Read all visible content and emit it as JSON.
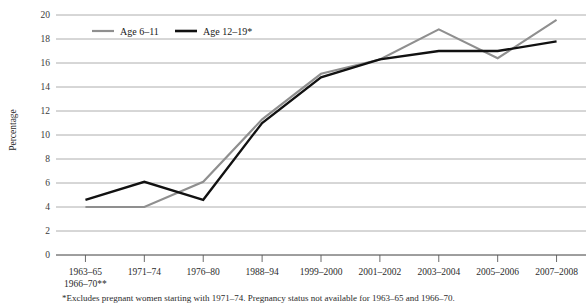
{
  "chart_data": {
    "type": "line",
    "title": "",
    "xlabel": "",
    "ylabel": "Percentage",
    "ylim": [
      0,
      20
    ],
    "ytick_step": 2,
    "grid": true,
    "legend_position": "top-left-inside",
    "categories": [
      "1963–65\n1966–70**",
      "1971–74",
      "1976–80",
      "1988–94",
      "1999–2000",
      "2001–2002",
      "2003–2004",
      "2005–2006",
      "2007–2008"
    ],
    "category_labels": [
      {
        "line1": "1963–65",
        "line2": "1966–70**"
      },
      {
        "line1": "1971–74",
        "line2": ""
      },
      {
        "line1": "1976–80",
        "line2": ""
      },
      {
        "line1": "1988–94",
        "line2": ""
      },
      {
        "line1": "1999–2000",
        "line2": ""
      },
      {
        "line1": "2001–2002",
        "line2": ""
      },
      {
        "line1": "2003–2004",
        "line2": ""
      },
      {
        "line1": "2005–2006",
        "line2": ""
      },
      {
        "line1": "2007–2008",
        "line2": ""
      }
    ],
    "ytick_labels": [
      "0",
      "2",
      "4",
      "6",
      "8",
      "10",
      "12",
      "14",
      "16",
      "18",
      "20"
    ],
    "ytick_values": [
      0,
      2,
      4,
      6,
      8,
      10,
      12,
      14,
      16,
      18,
      20
    ],
    "series": [
      {
        "name": "Age 6–11",
        "color": "#8f8f8f",
        "values": [
          4.0,
          4.0,
          6.1,
          11.3,
          15.1,
          16.3,
          18.8,
          16.4,
          19.6
        ]
      },
      {
        "name": "Age 12–19*",
        "color": "#111111",
        "values": [
          4.6,
          6.1,
          4.6,
          11.0,
          14.8,
          16.3,
          17.0,
          17.0,
          17.8
        ]
      }
    ]
  },
  "legend": {
    "items": [
      {
        "label": "Age 6–11",
        "color": "#8f8f8f"
      },
      {
        "label": "Age 12–19*",
        "color": "#111111"
      }
    ]
  },
  "footnote": {
    "text": "*Excludes pregnant women starting with 1971–74. Pregnancy status not available for 1963–65 and 1966–70."
  },
  "colors": {
    "series_gray": "#8f8f8f",
    "series_black": "#111111",
    "gridline": "#9b9b9b",
    "axis": "#5a5a5a",
    "background": "#ffffff"
  }
}
